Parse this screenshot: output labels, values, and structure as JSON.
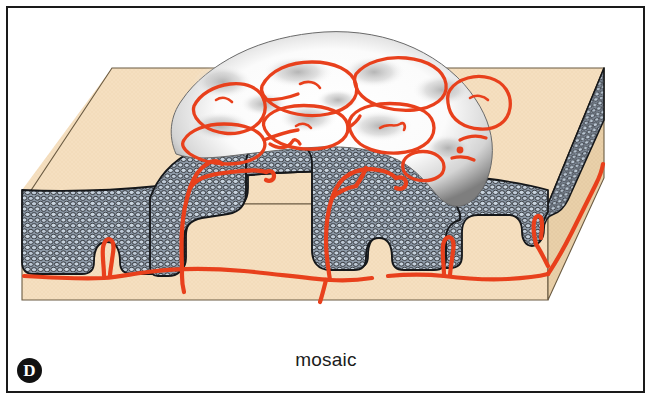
{
  "figure": {
    "panel_letter": "D",
    "caption": "mosaic",
    "frame_border_color": "#1a1a1a",
    "background_color": "#ffffff"
  },
  "colors": {
    "stroma_top": "#f5dfc0",
    "stroma_front": "#f3dcbc",
    "stroma_side_shadow": "#e2c9a4",
    "epithelium_fill": "#8e9aa8",
    "epithelium_cell": "#c3d0dc",
    "epithelium_outline": "#17181a",
    "acetowhite_light": "#ffffff",
    "acetowhite_shadow": "#9a9a9a",
    "vessel_red": "#e8401c",
    "panel_badge": "#111111"
  },
  "regions": [
    {
      "name": "stroma-block",
      "label": "connective tissue stroma (dermis)",
      "color": "#f5dfc0"
    },
    {
      "name": "epithelium-layer",
      "label": "squamous epithelium cell layer",
      "color": "#8e9aa8"
    },
    {
      "name": "acetowhite-lesion",
      "label": "acetowhite lesion surface",
      "color": "#ffffff"
    },
    {
      "name": "mosaic-vessel-network",
      "label": "mosaic capillary network",
      "color": "#e8401c"
    },
    {
      "name": "subepithelial-vessels",
      "label": "subepithelial horizontal capillary",
      "color": "#e8401c"
    }
  ],
  "mosaic_tiles": [
    {
      "id": "tile-1"
    },
    {
      "id": "tile-2"
    },
    {
      "id": "tile-3"
    },
    {
      "id": "tile-4"
    },
    {
      "id": "tile-5"
    },
    {
      "id": "tile-6"
    },
    {
      "id": "tile-7"
    },
    {
      "id": "tile-8"
    },
    {
      "id": "tile-9"
    },
    {
      "id": "tile-10"
    }
  ]
}
